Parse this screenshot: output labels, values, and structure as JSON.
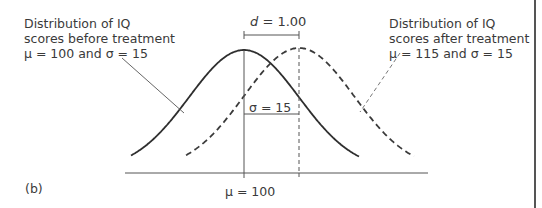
{
  "figure": {
    "panel_label": "(b)",
    "effect_size_label": {
      "symbol": "d",
      "text": " = 1.00"
    },
    "sigma_label": "σ = 15",
    "mean_axis_label": "μ = 100",
    "before_treatment": {
      "lines": [
        "Distribution of IQ",
        "scores before treatment",
        "μ = 100 and σ = 15"
      ],
      "mean": 100,
      "sd": 15,
      "line_style": "solid"
    },
    "after_treatment": {
      "lines": [
        "Distribution of IQ",
        "scores after treatment",
        "μ = 115 and σ = 15"
      ],
      "mean": 115,
      "sd": 15,
      "line_style": "dashed"
    },
    "colors": {
      "ink": "#3a3a3a",
      "frame": "#555555",
      "background": "#ffffff"
    }
  }
}
